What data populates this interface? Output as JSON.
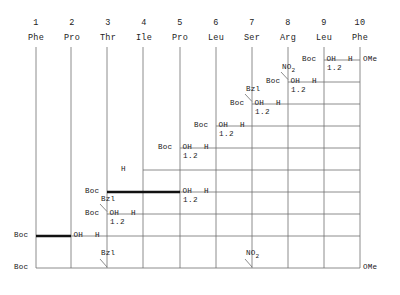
{
  "diagram": {
    "type": "peptide-fragment-condensation-scheme",
    "residue_numbers": [
      "1",
      "2",
      "3",
      "4",
      "5",
      "6",
      "7",
      "8",
      "9",
      "10"
    ],
    "residues": [
      "Phe",
      "Pro",
      "Thr",
      "Ile",
      "Pro",
      "Leu",
      "Ser",
      "Arg",
      "Leu",
      "Phe"
    ],
    "terminus_right": "OMe",
    "colors": {
      "line": "#6f6f6f",
      "bold_line": "#111111",
      "text": "#1a1a1a",
      "background": "#ffffff"
    },
    "steps": [
      {
        "id": "step-boc-ome-col9",
        "left_label": "Boc",
        "oh_label": "OH",
        "h_label": "H",
        "right_label": "OMe",
        "ratio": "1.2",
        "protecting_group": "",
        "start_col": 9,
        "oh_col": 9,
        "h_col": 10,
        "end_col": 10,
        "row": 1,
        "bold": false
      },
      {
        "id": "step-no2-col8",
        "left_label": "Boc",
        "oh_label": "OH",
        "h_label": "H",
        "right_label": "",
        "ratio": "1.2",
        "protecting_group": "NO2",
        "start_col": 8,
        "oh_col": 8,
        "h_col": 9,
        "end_col": 10,
        "row": 2,
        "bold": false
      },
      {
        "id": "step-bzl-col7",
        "left_label": "Boc",
        "oh_label": "OH",
        "h_label": "H",
        "right_label": "",
        "ratio": "1.2",
        "protecting_group": "Bzl",
        "start_col": 7,
        "oh_col": 7,
        "h_col": 8,
        "end_col": 10,
        "row": 3,
        "bold": false
      },
      {
        "id": "step-col6",
        "left_label": "Boc",
        "oh_label": "OH",
        "h_label": "H",
        "right_label": "",
        "ratio": "1.2",
        "protecting_group": "",
        "start_col": 6,
        "oh_col": 6,
        "h_col": 7,
        "end_col": 10,
        "row": 4,
        "bold": false
      },
      {
        "id": "step-col5",
        "left_label": "Boc",
        "oh_label": "OH",
        "h_label": "H",
        "right_label": "",
        "ratio": "1.2",
        "protecting_group": "",
        "start_col": 5,
        "oh_col": 5,
        "h_col": 6,
        "end_col": 10,
        "row": 5,
        "bold": false
      },
      {
        "id": "step-h-col4",
        "left_label": "H",
        "oh_label": "",
        "h_label": "",
        "right_label": "",
        "ratio": "",
        "protecting_group": "",
        "start_col": 4,
        "oh_col": 0,
        "h_col": 0,
        "end_col": 10,
        "row": 6,
        "bold": false
      },
      {
        "id": "step-bold-col3-col5",
        "left_label": "Boc",
        "oh_label": "OH",
        "h_label": "H",
        "right_label": "",
        "ratio": "1.2",
        "protecting_group": "",
        "start_col": 3,
        "oh_col": 5,
        "h_col": 6,
        "end_col": 10,
        "row": 7,
        "bold": true
      },
      {
        "id": "step-bzl-col3",
        "left_label": "Boc",
        "oh_label": "OH",
        "h_label": "H",
        "right_label": "",
        "ratio": "1.2",
        "protecting_group": "Bzl",
        "start_col": 3,
        "oh_col": 3,
        "h_col": 4,
        "end_col": 10,
        "row": 8,
        "bold": false
      },
      {
        "id": "step-bold-col1-col2",
        "left_label": "Boc",
        "oh_label": "OH",
        "h_label": "H",
        "right_label": "",
        "ratio": "",
        "protecting_group": "",
        "start_col": 1,
        "oh_col": 2,
        "h_col": 3,
        "end_col": 10,
        "row": 9,
        "bold": true
      },
      {
        "id": "step-final-col1",
        "left_label": "Boc",
        "oh_label": "",
        "h_label": "",
        "right_label": "OMe",
        "ratio": "",
        "protecting_group": "",
        "start_col": 1,
        "oh_col": 0,
        "h_col": 0,
        "end_col": 10,
        "row": 10,
        "bold": false
      }
    ],
    "bottom_protecting_groups": [
      {
        "id": "bottom-bzl",
        "label": "Bzl",
        "col": 3
      },
      {
        "id": "bottom-no2",
        "label": "NO2",
        "col": 7
      }
    ]
  }
}
